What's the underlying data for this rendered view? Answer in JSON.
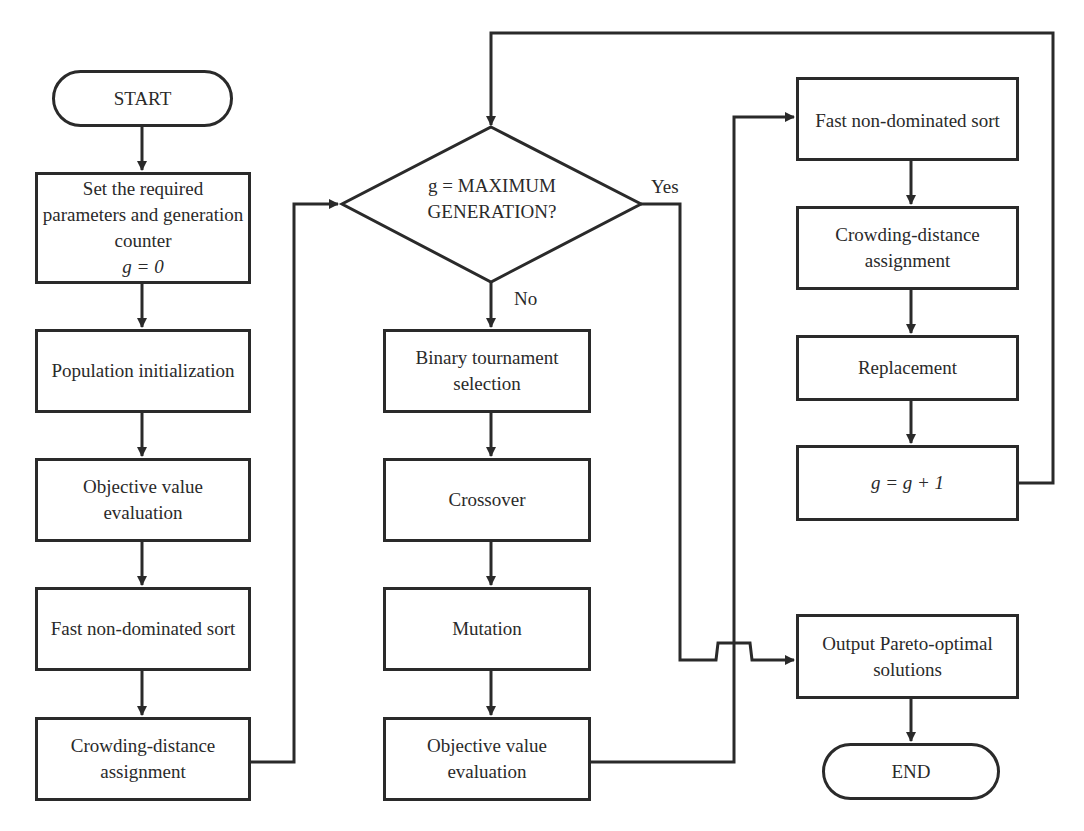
{
  "diagram": {
    "start": "START",
    "end": "END",
    "left_column": [
      {
        "id": "set-params",
        "text": "Set the required parameters and generation counter",
        "sub": "g = 0"
      },
      {
        "id": "pop-init",
        "text": "Population initialization"
      },
      {
        "id": "obj-eval-1",
        "text": "Objective value evaluation"
      },
      {
        "id": "fast-sort-1",
        "text": "Fast non-dominated sort"
      },
      {
        "id": "crowding-1",
        "text": "Crowding-distance assignment"
      }
    ],
    "decision": {
      "line1": "g = MAXIMUM",
      "line2": "GENERATION?",
      "yes": "Yes",
      "no": "No"
    },
    "middle_column": [
      {
        "id": "tournament",
        "text": "Binary tournament selection"
      },
      {
        "id": "crossover",
        "text": "Crossover"
      },
      {
        "id": "mutation",
        "text": "Mutation"
      },
      {
        "id": "obj-eval-2",
        "text": "Objective value evaluation"
      }
    ],
    "right_column": [
      {
        "id": "fast-sort-2",
        "text": "Fast non-dominated sort"
      },
      {
        "id": "crowding-2",
        "text": "Crowding-distance assignment"
      },
      {
        "id": "replacement",
        "text": "Replacement"
      },
      {
        "id": "increment",
        "text": "g = g + 1"
      }
    ],
    "output": "Output Pareto-optimal solutions"
  }
}
